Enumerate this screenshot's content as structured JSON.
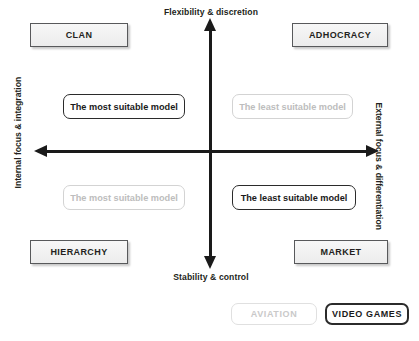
{
  "diagram": {
    "axes": {
      "top_label": "Flexibility & discretion",
      "bottom_label": "Stability & control",
      "left_label": "Internal focus & integration",
      "right_label": "External focus & differentiation"
    },
    "quadrant_boxes": [
      {
        "id": "clan",
        "label": "CLAN",
        "position": "top-left"
      },
      {
        "id": "adhocracy",
        "label": "ADHOCRACY",
        "position": "top-right"
      },
      {
        "id": "hierarchy",
        "label": "HIERARCHY",
        "position": "bottom-left"
      },
      {
        "id": "market",
        "label": "MARKET",
        "position": "bottom-right"
      }
    ],
    "callouts": [
      {
        "id": "top-left",
        "label": "The most suitable model",
        "emphasis": "strong",
        "series": "video-games"
      },
      {
        "id": "top-right",
        "label": "The least suitable model",
        "emphasis": "faded",
        "series": "aviation"
      },
      {
        "id": "bottom-left",
        "label": "The most suitable model",
        "emphasis": "faded",
        "series": "aviation"
      },
      {
        "id": "bottom-right",
        "label": "The least suitable model",
        "emphasis": "strong",
        "series": "video-games"
      }
    ],
    "legend": [
      {
        "id": "aviation",
        "label": "AVIATION",
        "emphasis": "faded"
      },
      {
        "id": "video-games",
        "label": "VIDEO GAMES",
        "emphasis": "strong"
      }
    ],
    "colors": {
      "axis": "#1a1a1a",
      "box_border": "#58595b",
      "box_fill": "#ececec",
      "strong_text": "#1a1a1a",
      "faded_text": "#bdbdbd",
      "faded_border": "#d3d3d3",
      "background": "#ffffff"
    }
  }
}
